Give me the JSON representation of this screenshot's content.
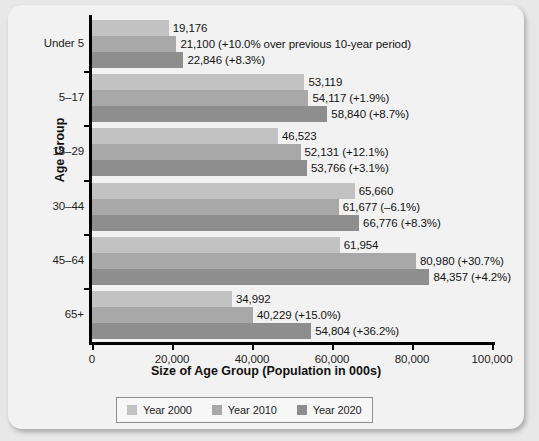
{
  "chart_data": {
    "type": "bar",
    "orientation": "horizontal",
    "title": "",
    "xlabel": "Size of Age Group (Population in 000s)",
    "ylabel": "Age Group",
    "xlim": [
      0,
      100000
    ],
    "xticks": [
      "0",
      "20,000",
      "40,000",
      "60,000",
      "80,000",
      "100,000"
    ],
    "xtick_values": [
      0,
      20000,
      40000,
      60000,
      80000,
      100000
    ],
    "grid": false,
    "legend_position": "bottom",
    "categories": [
      "Under 5",
      "5–17",
      "18–29",
      "30–44",
      "45–64",
      "65+"
    ],
    "series": [
      {
        "name": "Year 2000",
        "color": "#c2c2c2",
        "values": [
          19176,
          53119,
          46523,
          65660,
          61954,
          34992
        ],
        "labels": [
          "19,176",
          "53,119",
          "46,523",
          "65,660",
          "61,954",
          "34,992"
        ]
      },
      {
        "name": "Year 2010",
        "color": "#a8a8a8",
        "values": [
          21100,
          54117,
          52131,
          61677,
          80980,
          40229
        ],
        "labels": [
          "21,100 (+10.0% over previous 10-year period)",
          "54,117 (+1.9%)",
          "52,131 (+12.1%)",
          "61,677 (–6.1%)",
          "80,980 (+30.7%)",
          "40,229 (+15.0%)"
        ]
      },
      {
        "name": "Year 2020",
        "color": "#8e8e8e",
        "values": [
          22846,
          58840,
          53766,
          66776,
          84357,
          54804
        ],
        "labels": [
          "22,846 (+8.3%)",
          "58,840 (+8.7%)",
          "53,766 (+3.1%)",
          "66,776 (+8.3%)",
          "84,357 (+4.2%)",
          "54,804 (+36.2%)"
        ]
      }
    ]
  },
  "legend": {
    "items": [
      {
        "label": "Year 2000",
        "color": "#c2c2c2"
      },
      {
        "label": "Year 2010",
        "color": "#a8a8a8"
      },
      {
        "label": "Year 2020",
        "color": "#8e8e8e"
      }
    ]
  }
}
